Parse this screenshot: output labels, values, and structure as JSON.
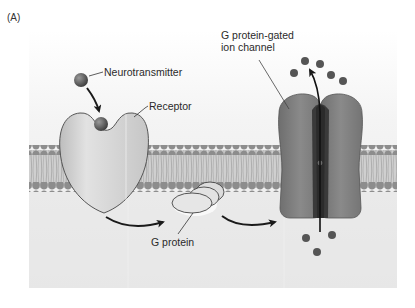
{
  "figure": {
    "panel_label": "(A)",
    "labels": {
      "neurotransmitter": "Neurotransmitter",
      "receptor": "Receptor",
      "g_protein": "G protein",
      "channel_line1": "G protein-gated",
      "channel_line2": "ion channel"
    },
    "colors": {
      "background": "#ffffff",
      "panel_bg": "#ececec",
      "panel_top": "#f6f6f6",
      "membrane_head": "#8e8e8e",
      "membrane_tail": "#c4c4c4",
      "receptor_fill": "#d2d2d2",
      "receptor_stroke": "#555555",
      "channel_fill": "#7c7c7c",
      "channel_dark": "#3a3a3a",
      "ion": "#555555",
      "arrow": "#1a1a1a"
    }
  }
}
